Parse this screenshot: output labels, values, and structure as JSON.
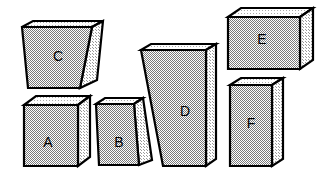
{
  "figure": {
    "background_color": "#ffffff",
    "outline_color": "#000000",
    "front_face_color": "#c8c8c8",
    "side_face_color": "#d8d8d8",
    "top_face_color": "#e4e4e4",
    "label_color": "#000000",
    "block_count": 6
  },
  "blocks": [
    {
      "id": "A",
      "label": "A",
      "shape": "rectangular-box",
      "front_shape": "rectangle",
      "label_x": 48,
      "label_y": 143,
      "front_points": "24,105 78,105 78,166 24,166",
      "side_points": "78,105 90,96 90,157 78,166",
      "top_points": "24,105 36,96 90,96 78,105"
    },
    {
      "id": "B",
      "label": "B",
      "shape": "tapered-box",
      "front_shape": "trapezoid-narrow-bottom",
      "label_x": 119,
      "label_y": 143,
      "front_points": "96,104 134,104 139,165 99,165",
      "side_points": "134,104 143,98 152,160 139,165",
      "top_points": "96,104 105,98 143,98 134,104"
    },
    {
      "id": "C",
      "label": "C",
      "shape": "tapered-box",
      "front_shape": "trapezoid-narrow-bottom",
      "label_x": 58,
      "label_y": 57,
      "front_points": "22,27 92,27 80,88 28,88",
      "side_points": "92,27 103,21 97,80 80,88",
      "top_points": "22,27 33,21 103,21 92,27"
    },
    {
      "id": "D",
      "label": "D",
      "shape": "tapered-box",
      "front_shape": "trapezoid-narrow-bottom",
      "label_x": 185,
      "label_y": 112,
      "front_points": "141,50 206,50 206,166 163,166",
      "side_points": "206,50 216,44 216,159 206,166",
      "top_points": "141,50 151,44 216,44 206,50"
    },
    {
      "id": "E",
      "label": "E",
      "shape": "rectangular-box",
      "front_shape": "rectangle",
      "label_x": 262,
      "label_y": 40,
      "front_points": "228,17 300,17 300,69 228,69",
      "side_points": "300,17 313,8 313,60 300,69",
      "top_points": "228,17 241,8 313,8 300,17"
    },
    {
      "id": "F",
      "label": "F",
      "shape": "rectangular-box",
      "front_shape": "rectangle",
      "label_x": 251,
      "label_y": 124,
      "front_points": "230,85 272,85 272,166 230,166",
      "side_points": "272,85 283,78 283,159 272,166",
      "top_points": "230,85 241,78 283,78 272,85"
    }
  ]
}
